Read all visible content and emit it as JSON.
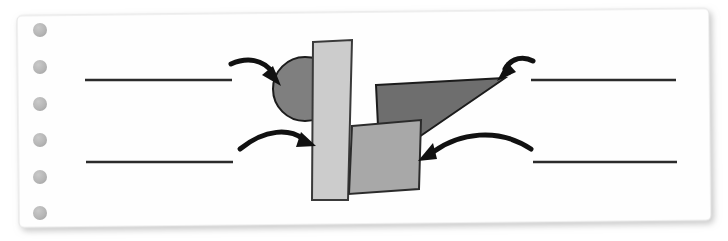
{
  "canvas": {
    "width": 728,
    "height": 241,
    "background": "#ffffff"
  },
  "worksheet": {
    "kind": "shape-labelling-worksheet",
    "paper": {
      "fill": "#fefefe",
      "border_color": "#e2e2e2",
      "shadow_color": "#c9c9c9",
      "x": 18,
      "y": 12,
      "width": 692,
      "height": 212,
      "corner_radius": 5,
      "rotation_deg": -0.6
    },
    "punch_holes": {
      "count": 6,
      "fill": "#b9b9b9",
      "diameter": 14,
      "center_x": 40,
      "centers_y": [
        30,
        67,
        104,
        140,
        177,
        213
      ]
    },
    "answer_lines": [
      {
        "id": "line-top-left",
        "x1": 85,
        "y1": 80,
        "x2": 232,
        "y2": 80,
        "color": "#2b2b2b",
        "thickness": 2.4
      },
      {
        "id": "line-top-right",
        "x1": 531,
        "y1": 80,
        "x2": 676,
        "y2": 80,
        "color": "#2b2b2b",
        "thickness": 2.4
      },
      {
        "id": "line-bottom-left",
        "x1": 86,
        "y1": 162,
        "x2": 233,
        "y2": 162,
        "color": "#2b2b2b",
        "thickness": 2.4
      },
      {
        "id": "line-bottom-right",
        "x1": 533,
        "y1": 162,
        "x2": 677,
        "y2": 162,
        "color": "#2b2b2b",
        "thickness": 2.4
      }
    ],
    "shapes": [
      {
        "id": "circle",
        "name": "circle",
        "type": "circle",
        "fill": "#7f7f7f",
        "stroke": "#1c1c1c",
        "stroke_width": 2,
        "cx": 305,
        "cy": 89,
        "r": 32
      },
      {
        "id": "tall-rectangle",
        "name": "rectangle",
        "type": "quadrilateral",
        "fill": "#cccccc",
        "stroke": "#3a3a3a",
        "stroke_width": 2,
        "points": "313,42 352,40 348,200 312,200"
      },
      {
        "id": "dark-triangle",
        "name": "triangle",
        "type": "quadrilateral",
        "fill": "#6e6e6e",
        "stroke": "#1c1c1c",
        "stroke_width": 2,
        "points": "376,85 505,78 419,137 378,126"
      },
      {
        "id": "tilted-square",
        "name": "square",
        "type": "quadrilateral",
        "fill": "#a8a8a8",
        "stroke": "#2b2b2b",
        "stroke_width": 2,
        "points": "352,126 421,120 419,189 349,194"
      }
    ],
    "arrows": [
      {
        "id": "arrow-to-circle",
        "points_to": "circle",
        "from_line": "line-top-left",
        "color": "#111111",
        "path": "M231,64 C247,58 262,60 272,74",
        "head": "278,84 264,74 272,70",
        "thickness": 5
      },
      {
        "id": "arrow-to-triangle",
        "points_to": "dark-triangle",
        "from_line": "line-top-right",
        "color": "#111111",
        "path": "M532,62 C524,57 513,58 506,70",
        "head": "499,79 508,65 513,73",
        "thickness": 5
      },
      {
        "id": "arrow-to-rectangle",
        "points_to": "tall-rectangle",
        "from_line": "line-bottom-left",
        "color": "#111111",
        "path": "M240,148 C266,128 290,130 304,140",
        "head": "314,145 298,146 302,134",
        "thickness": 5
      },
      {
        "id": "arrow-to-square",
        "points_to": "tilted-square",
        "from_line": "line-bottom-right",
        "color": "#111111",
        "path": "M530,148 C498,128 460,134 432,152",
        "head": "420,160 437,158 432,145",
        "thickness": 5
      }
    ]
  }
}
